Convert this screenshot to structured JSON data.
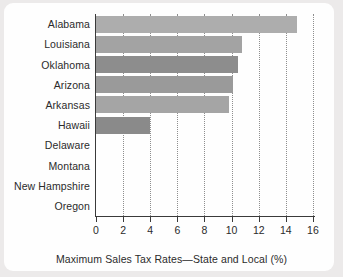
{
  "chart_data": {
    "type": "bar",
    "orientation": "horizontal",
    "title": "",
    "xlabel": "Maximum Sales Tax Rates—State and Local (%)",
    "ylabel": "",
    "xlim": [
      0,
      16.5
    ],
    "xticks": [
      0,
      2,
      4,
      6,
      8,
      10,
      12,
      14,
      16
    ],
    "xticklabels": [
      "0",
      "2",
      "4",
      "6",
      "8",
      "10",
      "12",
      "14",
      "16"
    ],
    "grid": "vertical-dotted",
    "legend": "none",
    "categories": [
      "Alabama",
      "Louisiana",
      "Oklahoma",
      "Arizona",
      "Arkansas",
      "Hawaii",
      "Delaware",
      "Montana",
      "New Hampshire",
      "Oregon"
    ],
    "values": [
      14.8,
      10.8,
      10.5,
      10.1,
      9.8,
      4.0,
      0,
      0,
      0,
      0
    ],
    "bar_colors": [
      "#adadad",
      "#a3a3a3",
      "#8d8d8d",
      "#9a9a9a",
      "#a5a5a5",
      "#8a8a8a",
      "#9a9a9a",
      "#9a9a9a",
      "#9a9a9a",
      "#9a9a9a"
    ],
    "axis_color": "#3a3a3a",
    "gridline_color": "#8e8e8e",
    "background_color": "#fefefe",
    "page_background_color": "#eceaea",
    "text_color": "#2b2b2b"
  }
}
